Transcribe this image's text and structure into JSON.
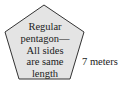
{
  "diagram": {
    "shape": "regular-pentagon",
    "fill_color": "#e4e4e4",
    "stroke_color": "#333333",
    "inner_text_lines": [
      "Regular",
      "pentagon—",
      "All sides",
      "are same",
      "length"
    ],
    "side_label": "7 meters"
  }
}
